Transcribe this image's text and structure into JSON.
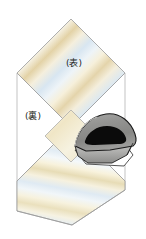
{
  "illustration": {
    "title": "Folded striped fabric with iron",
    "type": "sewing-instruction-diagram",
    "labels": [
      {
        "id": "front-side",
        "text": "(表)",
        "meaning": "front side / right side of fabric",
        "x": 74,
        "y": 63
      },
      {
        "id": "back-side",
        "text": "(裏)",
        "meaning": "back side / wrong side of fabric",
        "x": 33,
        "y": 116
      }
    ],
    "colors": {
      "outline": "#9a9a9a",
      "fold_outline": "#b5b5b5",
      "stripe_cream": "#f4ecd8",
      "stripe_tan": "#e8d3a8",
      "stripe_blue": "#d4e4ef",
      "stripe_pale_blue": "#e8f1f7",
      "stripe_yellow": "#f5edcb",
      "fabric_base": "#fbf8ee",
      "iron_body": "#8f8f8f",
      "iron_body_light": "#b0b0b0",
      "iron_handle": "#0d0d0d",
      "iron_outline": "#1a1a1a",
      "iron_sole": "#ffffff",
      "text": "#231f20"
    },
    "panels": [
      {
        "id": "upper-panel",
        "shape": "rhombus",
        "description": "upper folded fabric panel shown front side up with diagonal stripes"
      },
      {
        "id": "center-fold",
        "shape": "small-rhombus",
        "description": "small fold crease panel at center"
      },
      {
        "id": "lower-panel",
        "shape": "parallelogram",
        "description": "lower fabric panel lying flat with stripes"
      },
      {
        "id": "iron",
        "shape": "iron",
        "description": "clothes iron pressing the lower panel, nose pointing right"
      }
    ]
  }
}
